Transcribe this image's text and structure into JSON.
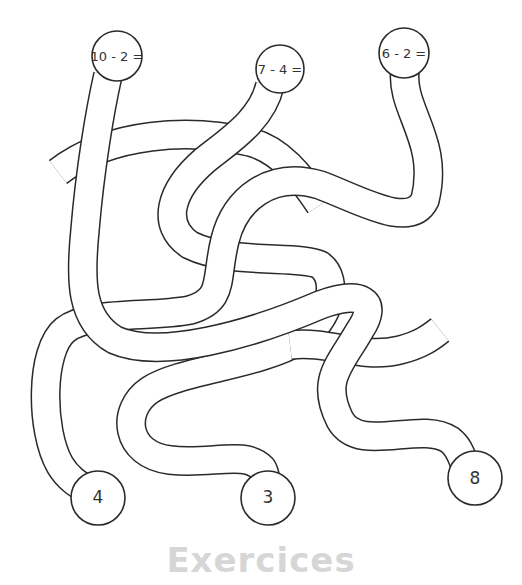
{
  "worksheet": {
    "type": "maze-matching",
    "problems": [
      {
        "id": "p1",
        "label": "10 - 2 =",
        "answer": "8"
      },
      {
        "id": "p2",
        "label": "7 - 4 =",
        "answer": "3"
      },
      {
        "id": "p3",
        "label": "6 - 2 =",
        "answer": "4"
      }
    ],
    "answers": [
      {
        "id": "a1",
        "label": "4"
      },
      {
        "id": "a2",
        "label": "3"
      },
      {
        "id": "a3",
        "label": "8"
      }
    ],
    "footer_title": "Exercices",
    "colors": {
      "line": "#2a2a2a",
      "text": "#333333",
      "footer": "#d6d6d6",
      "background": "#ffffff"
    }
  }
}
